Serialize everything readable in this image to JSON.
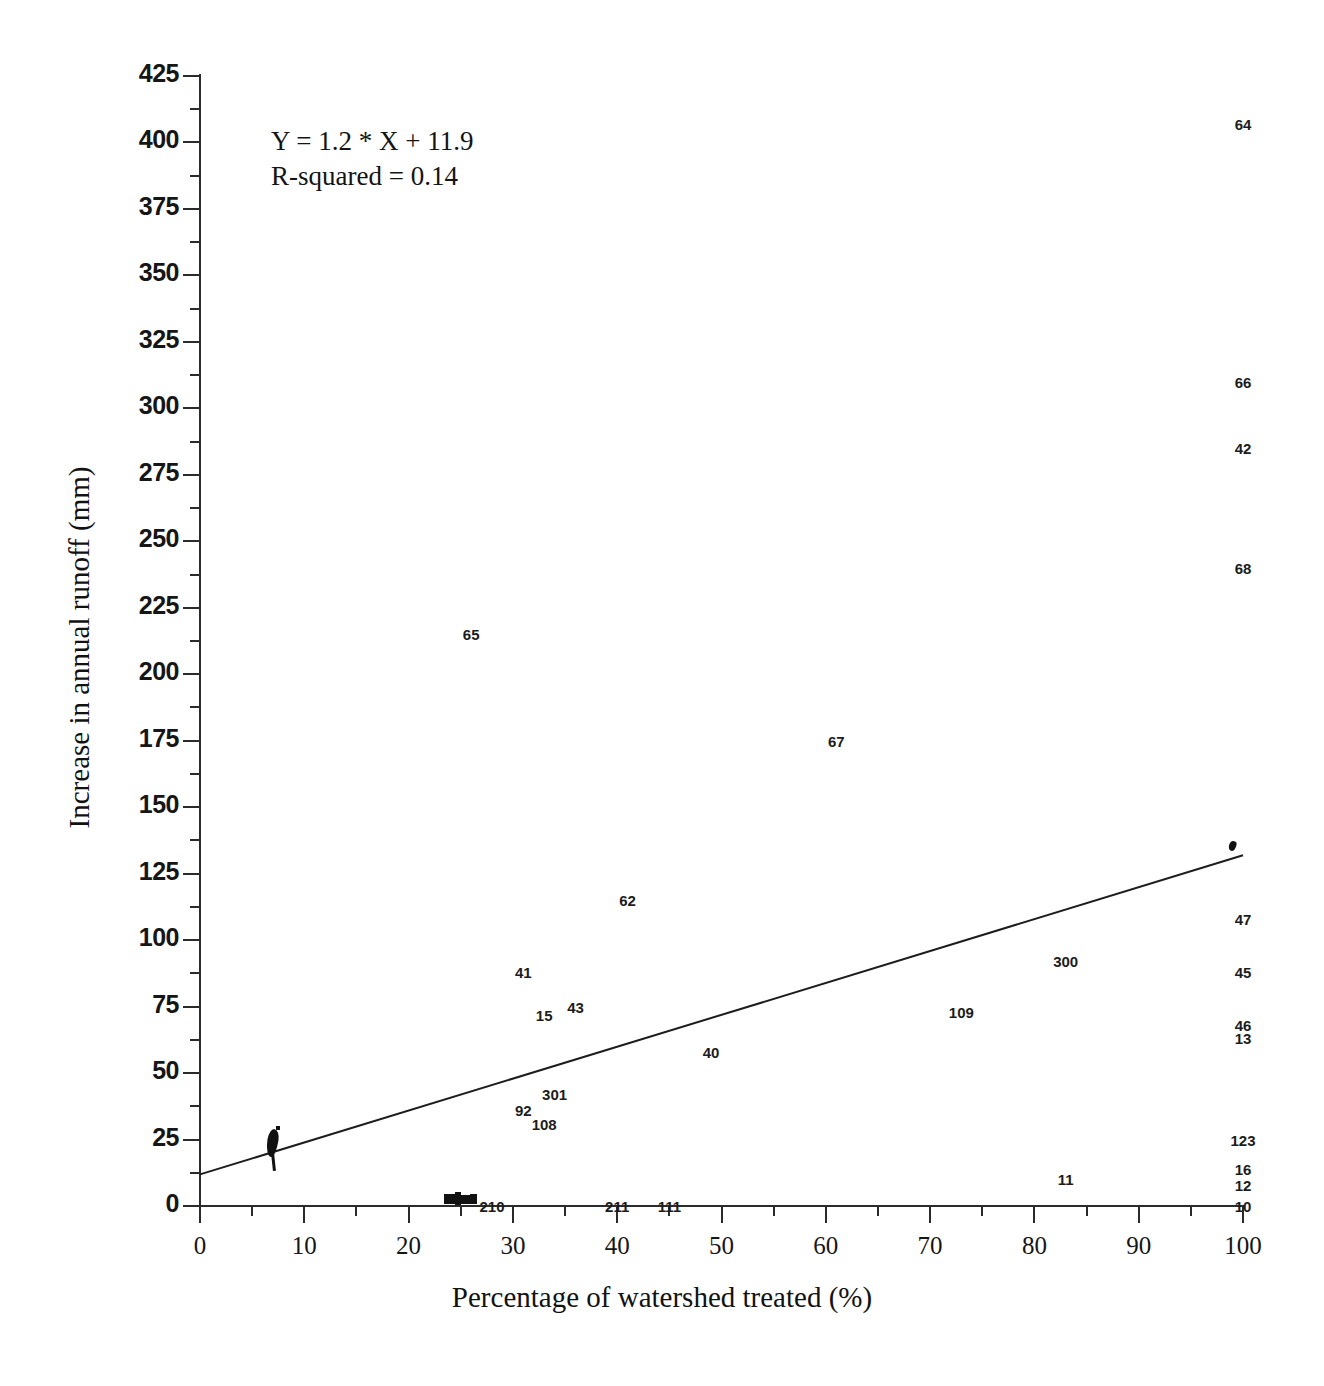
{
  "chart_data": {
    "type": "scatter",
    "title": "",
    "xlabel": "Percentage of watershed treated (%)",
    "ylabel": "Increase in annual runoff (mm)",
    "xlim": [
      0,
      100
    ],
    "ylim": [
      0,
      425
    ],
    "xticks": [
      0,
      10,
      20,
      30,
      40,
      50,
      60,
      70,
      80,
      90,
      100
    ],
    "yticks": [
      0,
      25,
      50,
      75,
      100,
      125,
      150,
      175,
      200,
      225,
      250,
      275,
      300,
      325,
      350,
      375,
      400,
      425
    ],
    "minor_ticks": true,
    "grid": false,
    "legend": "none",
    "annotations": [
      "Y = 1.2 * X + 11.9",
      "R-squared = 0.14"
    ],
    "trendline": {
      "slope": 1.2,
      "intercept": 11.9,
      "r_squared": 0.14,
      "x_start": 0,
      "y_start": 11.9,
      "x_end": 100,
      "y_end": 131.9
    },
    "point_label_note": "Each data point is drawn as its numeric watershed ID label",
    "points": [
      {
        "label": "64",
        "x": 100,
        "y": 407
      },
      {
        "label": "66",
        "x": 100,
        "y": 310
      },
      {
        "label": "42",
        "x": 100,
        "y": 285
      },
      {
        "label": "68",
        "x": 100,
        "y": 240
      },
      {
        "label": "65",
        "x": 26,
        "y": 215
      },
      {
        "label": "67",
        "x": 61,
        "y": 175
      },
      {
        "label": "62",
        "x": 41,
        "y": 115
      },
      {
        "label": "47",
        "x": 100,
        "y": 108
      },
      {
        "label": "41",
        "x": 31,
        "y": 88
      },
      {
        "label": "300",
        "x": 83,
        "y": 92
      },
      {
        "label": "45",
        "x": 100,
        "y": 88
      },
      {
        "label": "43",
        "x": 36,
        "y": 75
      },
      {
        "label": "109",
        "x": 73,
        "y": 73
      },
      {
        "label": "15",
        "x": 33,
        "y": 72
      },
      {
        "label": "46",
        "x": 100,
        "y": 68
      },
      {
        "label": "13",
        "x": 100,
        "y": 63
      },
      {
        "label": "40",
        "x": 49,
        "y": 58
      },
      {
        "label": "301",
        "x": 34,
        "y": 42
      },
      {
        "label": "92",
        "x": 31,
        "y": 36
      },
      {
        "label": "108",
        "x": 33,
        "y": 31
      },
      {
        "label": "123",
        "x": 100,
        "y": 25
      },
      {
        "label": "16",
        "x": 100,
        "y": 14
      },
      {
        "label": "12",
        "x": 100,
        "y": 8
      },
      {
        "label": "11",
        "x": 83,
        "y": 10
      },
      {
        "label": "210",
        "x": 28,
        "y": 0
      },
      {
        "label": "211",
        "x": 40,
        "y": 0
      },
      {
        "label": "111",
        "x": 45,
        "y": 0
      },
      {
        "label": "10",
        "x": 100,
        "y": 0
      }
    ],
    "overplotted_clusters": [
      {
        "x": 7,
        "y": 12,
        "note": "dense overlapping labels near x=7"
      },
      {
        "x": 25,
        "y": 0,
        "note": "dense overlapping labels on axis near x=25"
      }
    ]
  },
  "axis": {
    "y_tick_labels": [
      "425",
      "400",
      "375",
      "350",
      "325",
      "300",
      "275",
      "250",
      "225",
      "200",
      "175",
      "150",
      "125",
      "100",
      "75",
      "50",
      "25",
      "0"
    ],
    "x_tick_labels": [
      "0",
      "10",
      "20",
      "30",
      "40",
      "50",
      "60",
      "70",
      "80",
      "90",
      "100"
    ],
    "x_title": "Percentage of watershed treated (%)",
    "y_title": "Increase in annual runoff (mm)"
  },
  "equation": {
    "line1": "Y = 1.2 * X + 11.9",
    "line2": "R-squared = 0.14"
  },
  "colors": {
    "axis": "#2b2b2b",
    "text": "#161616",
    "marker": "#111111",
    "background": "#ffffff"
  }
}
